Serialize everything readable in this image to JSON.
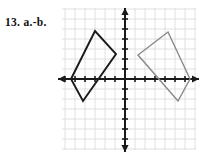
{
  "figure": {
    "label": "13. a.-b.",
    "caption_text": "13. a.-b.",
    "type": "coordinate-plane-reflection"
  },
  "colors": {
    "background": "#ffffff",
    "grid": "#d8d8d8",
    "axis": "#1a1a1a",
    "shape_preimage": "#1a1a1a",
    "shape_image": "#8a8a8a",
    "label_text": "#111111"
  },
  "graph": {
    "origin_px": {
      "x": 125,
      "y": 79
    },
    "unit_px": 10,
    "grid_bounds_px": {
      "left": 62,
      "top": 8,
      "right": 196,
      "bottom": 150
    },
    "grid_spacing_px": 10,
    "grid_visible": true,
    "xaxis": {
      "name": "x-axis",
      "start_px": {
        "x": 58,
        "y": 79
      },
      "end_px": {
        "x": 199,
        "y": 79
      },
      "arrow_left": true,
      "arrow_right": true,
      "tick_spacing_px": 10,
      "tick_half_length_px": 3,
      "tick_count_left": 6,
      "tick_count_right": 6
    },
    "yaxis": {
      "name": "y-axis",
      "start_px": {
        "x": 125,
        "y": 8
      },
      "end_px": {
        "x": 125,
        "y": 152
      },
      "arrow_top": true,
      "arrow_bottom": true,
      "tick_spacing_px": 10,
      "tick_half_length_px": 3,
      "tick_count_up": 6,
      "tick_count_down": 6
    },
    "tick_labels_visible": false,
    "axis_labels_visible": false
  },
  "chart_data": {
    "type": "scatter",
    "title": "13. a.-b.",
    "xlabel": "",
    "ylabel": "",
    "xlim": [
      -6.5,
      7.5
    ],
    "ylim": [
      -7.5,
      7.5
    ],
    "grid": true,
    "legend": "none",
    "series": [
      {
        "name": "preimage-quadrilateral",
        "color": "#1a1a1a",
        "closed": true,
        "vertices_units": [
          [
            -5.4,
            0.0
          ],
          [
            -3.0,
            4.8
          ],
          [
            -0.9,
            2.5
          ],
          [
            -4.2,
            -2.2
          ]
        ],
        "vertices_px": [
          [
            71,
            79
          ],
          [
            95,
            31
          ],
          [
            116,
            54
          ],
          [
            83,
            101
          ]
        ]
      },
      {
        "name": "image-quadrilateral",
        "color": "#8a8a8a",
        "closed": true,
        "vertices_units": [
          [
            1.3,
            2.4
          ],
          [
            4.3,
            4.7
          ],
          [
            6.5,
            0.0
          ],
          [
            5.3,
            -2.2
          ]
        ],
        "vertices_px": [
          [
            138,
            55
          ],
          [
            168,
            32
          ],
          [
            190,
            79
          ],
          [
            178,
            101
          ]
        ]
      }
    ]
  }
}
